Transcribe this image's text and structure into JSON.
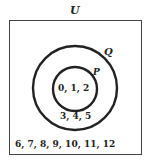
{
  "diagram": {
    "type": "venn",
    "universal_label": "U",
    "outer_set_label": "Q",
    "inner_set_label": "P",
    "inner_elements": "0, 1, 2",
    "ring_elements": "3, 4, 5",
    "outside_elements": "6, 7, 8, 9, 10, 11, 12"
  }
}
